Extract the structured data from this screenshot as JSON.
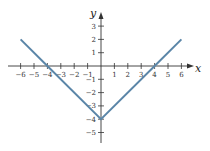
{
  "chart_data": {
    "type": "line",
    "title": "",
    "function": "y = |x| - 4",
    "xlabel": "x",
    "ylabel": "y",
    "xlim": [
      -6,
      6
    ],
    "ylim": [
      -5,
      3
    ],
    "x_ticks": [
      -6,
      -5,
      -4,
      -3,
      -2,
      -1,
      1,
      2,
      3,
      4,
      5,
      6
    ],
    "y_ticks": [
      -5,
      -4,
      -3,
      -2,
      -1,
      1,
      2,
      3
    ],
    "grid": false,
    "series": [
      {
        "name": "y = |x| - 4",
        "color": "#5b86a8",
        "x": [
          -6,
          -4,
          0,
          4,
          6
        ],
        "y": [
          2,
          0,
          -4,
          0,
          2
        ]
      }
    ]
  },
  "labels": {
    "x_axis": "x",
    "y_axis": "y"
  }
}
